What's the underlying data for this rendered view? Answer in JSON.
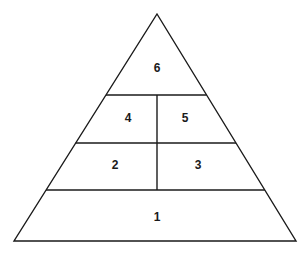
{
  "diagram": {
    "type": "pyramid",
    "title": "",
    "stroke_color": "#1a1a1a",
    "fill_color": "#ffffff",
    "background_color": "#ffffff",
    "stroke_width": 1.4,
    "apex": {
      "x": 157,
      "y": 14
    },
    "base_left": {
      "x": 14,
      "y": 241
    },
    "base_right": {
      "x": 296,
      "y": 241
    },
    "tiers": [
      {
        "name": "tier-base",
        "y_top": 190,
        "y_bottom": 241,
        "divided": false
      },
      {
        "name": "tier-lower-middle",
        "y_top": 143,
        "y_bottom": 190,
        "divided": true
      },
      {
        "name": "tier-upper-middle",
        "y_top": 95,
        "y_bottom": 143,
        "divided": true
      },
      {
        "name": "tier-apex",
        "y_top": 14,
        "y_bottom": 95,
        "divided": false
      }
    ],
    "vertical_divider": {
      "x": 157,
      "y_top": 95,
      "y_bottom": 190
    },
    "segments": [
      {
        "id": "segment-1",
        "label": "1",
        "x": 157,
        "y": 217,
        "tier": "tier-base",
        "position": "full"
      },
      {
        "id": "segment-2",
        "label": "2",
        "x": 115,
        "y": 165,
        "tier": "tier-lower-middle",
        "position": "left"
      },
      {
        "id": "segment-3",
        "label": "3",
        "x": 198,
        "y": 165,
        "tier": "tier-lower-middle",
        "position": "right"
      },
      {
        "id": "segment-4",
        "label": "4",
        "x": 128,
        "y": 118,
        "tier": "tier-upper-middle",
        "position": "left"
      },
      {
        "id": "segment-5",
        "label": "5",
        "x": 185,
        "y": 118,
        "tier": "tier-upper-middle",
        "position": "right"
      },
      {
        "id": "segment-6",
        "label": "6",
        "x": 157,
        "y": 68,
        "tier": "tier-apex",
        "position": "full"
      }
    ]
  }
}
